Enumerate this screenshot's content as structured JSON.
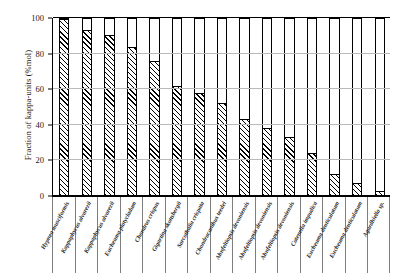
{
  "chart_data": {
    "type": "bar",
    "title": "",
    "xlabel": "",
    "ylabel": "Fraction of kappa-units (%mol)",
    "ylim": [
      0,
      100
    ],
    "yticks": [
      0,
      20,
      40,
      60,
      80,
      100
    ],
    "ytick_labels": [
      "0",
      "20",
      "40",
      "60",
      "80",
      "100"
    ],
    "grid": true,
    "legend": "none",
    "bar_style": "hatched-diagonal-outlined",
    "categories": [
      "Hypnea musciformis",
      "Kappaphycus alvarezii",
      "Kappaphycus alvarezii",
      "Eucheuma platycladum",
      "Chondrus crispus",
      "Gigartina skottsbergii",
      "Sarcothalia crispata",
      "Chondracanthus teedei",
      "Ahnfeltiopsis devoniensis",
      "Ahnfeltiopsis devoniensis",
      "Ahnfeltiopsis devoniensis",
      "Catenella impudica",
      "Eucheuma denticulatum",
      "Eucheuma denticulatum",
      "Agardhiella sp."
    ],
    "values": [
      100,
      94,
      91,
      84,
      76,
      62,
      58,
      52,
      43,
      38,
      33,
      24,
      12,
      7,
      2
    ],
    "total": 100
  },
  "axis": {
    "y_title": "Fraction of kappa-units (%mol)"
  }
}
